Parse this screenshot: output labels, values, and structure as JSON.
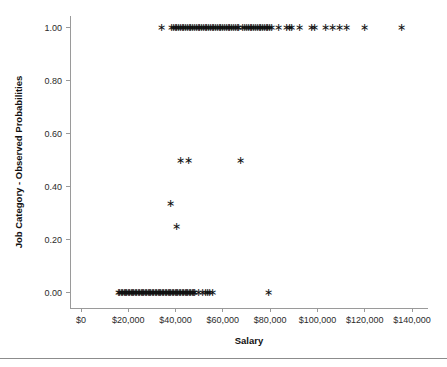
{
  "chart_data": {
    "type": "scatter",
    "title": "",
    "xlabel": "Salary",
    "ylabel": "Job Category - Observed Probabilities",
    "xlim": [
      -5000,
      150000
    ],
    "ylim": [
      -0.05,
      1.06
    ],
    "grid": false,
    "legend": null,
    "marker": "asterisk",
    "marker_color": "#111111",
    "xticks": [
      0,
      20000,
      40000,
      60000,
      80000,
      100000,
      120000,
      140000
    ],
    "xticklabels": [
      "$0",
      "$20,000",
      "$40,000",
      "$60,000",
      "$80,000",
      "$100,000",
      "$120,000",
      "$140,000"
    ],
    "yticks": [
      0.0,
      0.2,
      0.4,
      0.6,
      0.8,
      1.0
    ],
    "yticklabels": [
      "0.00",
      "0.20",
      "0.40",
      "0.60",
      "0.80",
      "1.00"
    ],
    "points": [
      {
        "x": 33900,
        "y": 1.0
      },
      {
        "x": 38200,
        "y": 1.0
      },
      {
        "x": 39000,
        "y": 1.0
      },
      {
        "x": 39800,
        "y": 1.0
      },
      {
        "x": 40500,
        "y": 1.0
      },
      {
        "x": 41300,
        "y": 1.0
      },
      {
        "x": 42000,
        "y": 1.0
      },
      {
        "x": 42800,
        "y": 1.0
      },
      {
        "x": 43500,
        "y": 1.0
      },
      {
        "x": 44200,
        "y": 1.0
      },
      {
        "x": 45000,
        "y": 1.0
      },
      {
        "x": 45800,
        "y": 1.0
      },
      {
        "x": 46500,
        "y": 1.0
      },
      {
        "x": 47200,
        "y": 1.0
      },
      {
        "x": 48000,
        "y": 1.0
      },
      {
        "x": 48800,
        "y": 1.0
      },
      {
        "x": 49500,
        "y": 1.0
      },
      {
        "x": 50200,
        "y": 1.0
      },
      {
        "x": 51000,
        "y": 1.0
      },
      {
        "x": 51800,
        "y": 1.0
      },
      {
        "x": 52500,
        "y": 1.0
      },
      {
        "x": 53200,
        "y": 1.0
      },
      {
        "x": 54000,
        "y": 1.0
      },
      {
        "x": 54800,
        "y": 1.0
      },
      {
        "x": 55500,
        "y": 1.0
      },
      {
        "x": 56200,
        "y": 1.0
      },
      {
        "x": 57000,
        "y": 1.0
      },
      {
        "x": 57800,
        "y": 1.0
      },
      {
        "x": 58500,
        "y": 1.0
      },
      {
        "x": 59200,
        "y": 1.0
      },
      {
        "x": 60000,
        "y": 1.0
      },
      {
        "x": 60800,
        "y": 1.0
      },
      {
        "x": 61500,
        "y": 1.0
      },
      {
        "x": 62300,
        "y": 1.0
      },
      {
        "x": 63000,
        "y": 1.0
      },
      {
        "x": 63800,
        "y": 1.0
      },
      {
        "x": 64500,
        "y": 1.0
      },
      {
        "x": 65200,
        "y": 1.0
      },
      {
        "x": 66000,
        "y": 1.0
      },
      {
        "x": 66800,
        "y": 1.0
      },
      {
        "x": 68500,
        "y": 1.0
      },
      {
        "x": 69300,
        "y": 1.0
      },
      {
        "x": 70000,
        "y": 1.0
      },
      {
        "x": 70800,
        "y": 1.0
      },
      {
        "x": 71500,
        "y": 1.0
      },
      {
        "x": 72300,
        "y": 1.0
      },
      {
        "x": 73000,
        "y": 1.0
      },
      {
        "x": 73800,
        "y": 1.0
      },
      {
        "x": 74500,
        "y": 1.0
      },
      {
        "x": 75300,
        "y": 1.0
      },
      {
        "x": 76000,
        "y": 1.0
      },
      {
        "x": 76800,
        "y": 1.0
      },
      {
        "x": 77500,
        "y": 1.0
      },
      {
        "x": 78300,
        "y": 1.0
      },
      {
        "x": 79000,
        "y": 1.0
      },
      {
        "x": 79800,
        "y": 1.0
      },
      {
        "x": 80500,
        "y": 1.0
      },
      {
        "x": 83500,
        "y": 1.0
      },
      {
        "x": 87000,
        "y": 1.0
      },
      {
        "x": 88000,
        "y": 1.0
      },
      {
        "x": 89200,
        "y": 1.0
      },
      {
        "x": 92500,
        "y": 1.0
      },
      {
        "x": 97500,
        "y": 1.0
      },
      {
        "x": 98800,
        "y": 1.0
      },
      {
        "x": 103500,
        "y": 1.0
      },
      {
        "x": 106500,
        "y": 1.0
      },
      {
        "x": 109500,
        "y": 1.0
      },
      {
        "x": 112500,
        "y": 1.0
      },
      {
        "x": 120000,
        "y": 1.0
      },
      {
        "x": 135500,
        "y": 1.0
      },
      {
        "x": 42000,
        "y": 0.5
      },
      {
        "x": 45500,
        "y": 0.5
      },
      {
        "x": 67500,
        "y": 0.5
      },
      {
        "x": 38000,
        "y": 0.335
      },
      {
        "x": 40500,
        "y": 0.25
      },
      {
        "x": 15800,
        "y": 0.0
      },
      {
        "x": 16400,
        "y": 0.0
      },
      {
        "x": 17000,
        "y": 0.0
      },
      {
        "x": 17600,
        "y": 0.0
      },
      {
        "x": 18200,
        "y": 0.0
      },
      {
        "x": 18800,
        "y": 0.0
      },
      {
        "x": 19400,
        "y": 0.0
      },
      {
        "x": 20000,
        "y": 0.0
      },
      {
        "x": 20600,
        "y": 0.0
      },
      {
        "x": 21200,
        "y": 0.0
      },
      {
        "x": 21800,
        "y": 0.0
      },
      {
        "x": 22400,
        "y": 0.0
      },
      {
        "x": 23000,
        "y": 0.0
      },
      {
        "x": 23600,
        "y": 0.0
      },
      {
        "x": 24200,
        "y": 0.0
      },
      {
        "x": 24800,
        "y": 0.0
      },
      {
        "x": 25400,
        "y": 0.0
      },
      {
        "x": 26000,
        "y": 0.0
      },
      {
        "x": 26600,
        "y": 0.0
      },
      {
        "x": 27200,
        "y": 0.0
      },
      {
        "x": 27800,
        "y": 0.0
      },
      {
        "x": 28400,
        "y": 0.0
      },
      {
        "x": 29000,
        "y": 0.0
      },
      {
        "x": 29600,
        "y": 0.0
      },
      {
        "x": 30200,
        "y": 0.0
      },
      {
        "x": 30800,
        "y": 0.0
      },
      {
        "x": 31400,
        "y": 0.0
      },
      {
        "x": 32000,
        "y": 0.0
      },
      {
        "x": 32600,
        "y": 0.0
      },
      {
        "x": 33200,
        "y": 0.0
      },
      {
        "x": 33800,
        "y": 0.0
      },
      {
        "x": 34400,
        "y": 0.0
      },
      {
        "x": 35000,
        "y": 0.0
      },
      {
        "x": 35600,
        "y": 0.0
      },
      {
        "x": 36200,
        "y": 0.0
      },
      {
        "x": 36800,
        "y": 0.0
      },
      {
        "x": 37400,
        "y": 0.0
      },
      {
        "x": 38000,
        "y": 0.0
      },
      {
        "x": 38600,
        "y": 0.0
      },
      {
        "x": 39200,
        "y": 0.0
      },
      {
        "x": 39800,
        "y": 0.0
      },
      {
        "x": 40400,
        "y": 0.0
      },
      {
        "x": 41000,
        "y": 0.0
      },
      {
        "x": 41600,
        "y": 0.0
      },
      {
        "x": 42200,
        "y": 0.0
      },
      {
        "x": 42800,
        "y": 0.0
      },
      {
        "x": 43400,
        "y": 0.0
      },
      {
        "x": 44000,
        "y": 0.0
      },
      {
        "x": 44600,
        "y": 0.0
      },
      {
        "x": 45200,
        "y": 0.0
      },
      {
        "x": 45800,
        "y": 0.0
      },
      {
        "x": 46400,
        "y": 0.0
      },
      {
        "x": 47000,
        "y": 0.0
      },
      {
        "x": 47600,
        "y": 0.0
      },
      {
        "x": 48200,
        "y": 0.0
      },
      {
        "x": 49500,
        "y": 0.0
      },
      {
        "x": 51500,
        "y": 0.0
      },
      {
        "x": 52500,
        "y": 0.0
      },
      {
        "x": 53500,
        "y": 0.0
      },
      {
        "x": 54500,
        "y": 0.0
      },
      {
        "x": 55500,
        "y": 0.0
      },
      {
        "x": 79500,
        "y": 0.0
      }
    ]
  }
}
